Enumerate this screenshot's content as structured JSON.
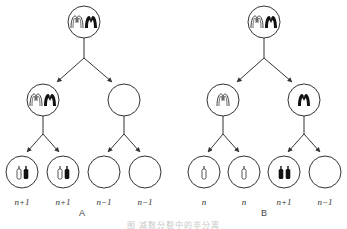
{
  "figure": {
    "caption": "图 减数分裂中的非分离",
    "colors": {
      "stroke": "#333333",
      "homolog_light": "#ffffff",
      "homolog_dark": "#111111",
      "background": "#ffffff"
    }
  },
  "panels": [
    {
      "label": "A",
      "description": "Nondisjunction in meiosis I",
      "parent_cell": {
        "contents": "homologous pair (light + dark bivalent)"
      },
      "meiosis_I_cells": [
        {
          "contents": "both homologs (light + dark)"
        },
        {
          "contents": "empty"
        }
      ],
      "gametes": [
        {
          "label": "n+1",
          "contents": "light + dark chromatid"
        },
        {
          "label": "n+1",
          "contents": "light + dark chromatid"
        },
        {
          "label": "n−1",
          "contents": "empty"
        },
        {
          "label": "n−1",
          "contents": "empty"
        }
      ]
    },
    {
      "label": "B",
      "description": "Nondisjunction in meiosis II",
      "parent_cell": {
        "contents": "homologous pair (light + dark bivalent)"
      },
      "meiosis_I_cells": [
        {
          "contents": "light homolog"
        },
        {
          "contents": "dark homolog"
        }
      ],
      "gametes": [
        {
          "label": "n",
          "contents": "light chromatid"
        },
        {
          "label": "n",
          "contents": "light chromatid"
        },
        {
          "label": "n+1",
          "contents": "two dark chromatids"
        },
        {
          "label": "n−1",
          "contents": "empty"
        }
      ]
    }
  ]
}
